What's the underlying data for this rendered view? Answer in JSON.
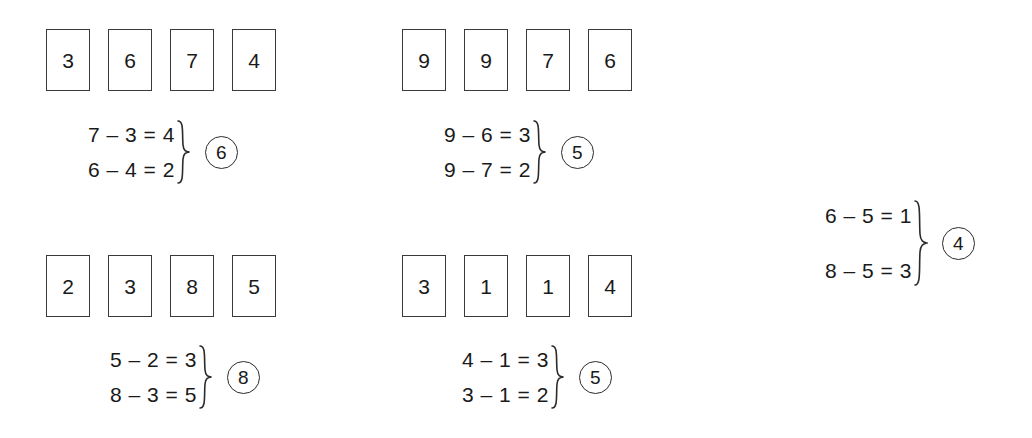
{
  "page": {
    "background_color": "#ffffff",
    "ink_color": "#1a1a1a",
    "border_color": "#3a3a3a"
  },
  "groups": [
    {
      "id": "group-1",
      "cards": [
        "3",
        "6",
        "7",
        "4"
      ],
      "equations": [
        "7 – 3 = 4",
        "6 – 4 = 2"
      ],
      "answer": "6"
    },
    {
      "id": "group-2",
      "cards": [
        "9",
        "9",
        "7",
        "6"
      ],
      "equations": [
        "9 – 6 = 3",
        "9 – 7 = 2"
      ],
      "answer": "5"
    },
    {
      "id": "group-3",
      "cards": [
        "2",
        "3",
        "8",
        "5"
      ],
      "equations": [
        "5 – 2 = 3",
        "8 – 3 = 5"
      ],
      "answer": "8"
    },
    {
      "id": "group-4",
      "cards": [
        "3",
        "1",
        "1",
        "4"
      ],
      "equations": [
        "4 – 1 = 3",
        "3 – 1 = 2"
      ],
      "answer": "5"
    },
    {
      "id": "group-5",
      "cards": [],
      "equations": [
        "6 – 5 = 1",
        "8 – 5 = 3"
      ],
      "answer": "4"
    }
  ]
}
